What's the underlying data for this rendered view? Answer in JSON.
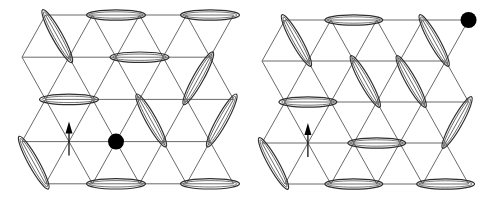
{
  "figure": {
    "panels": [
      {
        "id": "left",
        "rows": 5,
        "cols": 5,
        "row_offsets": [
          1,
          0,
          1,
          0,
          1
        ],
        "dimers": [
          {
            "a": [
              0,
              0
            ],
            "b": [
              1,
              1
            ]
          },
          {
            "a": [
              0,
              1
            ],
            "b": [
              0,
              2
            ]
          },
          {
            "a": [
              0,
              3
            ],
            "b": [
              0,
              4
            ]
          },
          {
            "a": [
              1,
              2
            ],
            "b": [
              1,
              3
            ]
          },
          {
            "a": [
              1,
              4
            ],
            "b": [
              2,
              3
            ]
          },
          {
            "a": [
              2,
              0
            ],
            "b": [
              2,
              1
            ]
          },
          {
            "a": [
              2,
              2
            ],
            "b": [
              3,
              3
            ]
          },
          {
            "a": [
              2,
              4
            ],
            "b": [
              3,
              4
            ]
          },
          {
            "a": [
              3,
              0
            ],
            "b": [
              4,
              0
            ]
          },
          {
            "a": [
              4,
              1
            ],
            "b": [
              4,
              2
            ]
          },
          {
            "a": [
              4,
              3
            ],
            "b": [
              4,
              4
            ]
          }
        ],
        "spinon": {
          "site": [
            3,
            1
          ],
          "direction": "up"
        },
        "holon": {
          "site": [
            3,
            2
          ]
        }
      },
      {
        "id": "right",
        "rows": 5,
        "cols": 5,
        "row_offsets": [
          1,
          0,
          1,
          0,
          1
        ],
        "dimers": [
          {
            "a": [
              0,
              0
            ],
            "b": [
              1,
              1
            ]
          },
          {
            "a": [
              0,
              1
            ],
            "b": [
              0,
              2
            ]
          },
          {
            "a": [
              0,
              3
            ],
            "b": [
              1,
              4
            ]
          },
          {
            "a": [
              1,
              2
            ],
            "b": [
              2,
              2
            ]
          },
          {
            "a": [
              1,
              3
            ],
            "b": [
              2,
              3
            ]
          },
          {
            "a": [
              2,
              0
            ],
            "b": [
              2,
              1
            ]
          },
          {
            "a": [
              2,
              4
            ],
            "b": [
              3,
              4
            ]
          },
          {
            "a": [
              3,
              0
            ],
            "b": [
              4,
              0
            ]
          },
          {
            "a": [
              3,
              2
            ],
            "b": [
              3,
              3
            ]
          },
          {
            "a": [
              4,
              1
            ],
            "b": [
              4,
              2
            ]
          },
          {
            "a": [
              4,
              3
            ],
            "b": [
              4,
              4
            ]
          }
        ],
        "spinon": {
          "site": [
            3,
            1
          ],
          "direction": "up"
        },
        "holon": {
          "site": [
            0,
            4
          ]
        }
      }
    ]
  }
}
